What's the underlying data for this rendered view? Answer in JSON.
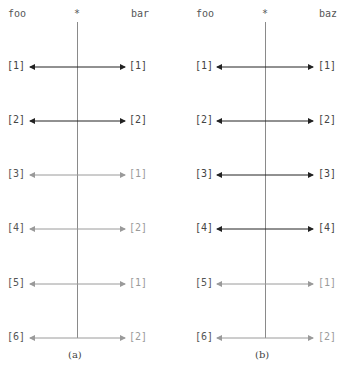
{
  "panels": [
    {
      "id": "a",
      "left_header": "foo",
      "center_header": "*",
      "right_header": "bar",
      "caption": "(a)",
      "rows": [
        {
          "left": "[1]",
          "right": "[1]",
          "emphasis": "dark"
        },
        {
          "left": "[2]",
          "right": "[2]",
          "emphasis": "dark"
        },
        {
          "left": "[3]",
          "right": "[1]",
          "emphasis": "light"
        },
        {
          "left": "[4]",
          "right": "[2]",
          "emphasis": "light"
        },
        {
          "left": "[5]",
          "right": "[1]",
          "emphasis": "light"
        },
        {
          "left": "[6]",
          "right": "[2]",
          "emphasis": "light"
        }
      ]
    },
    {
      "id": "b",
      "left_header": "foo",
      "center_header": "*",
      "right_header": "baz",
      "caption": "(b)",
      "rows": [
        {
          "left": "[1]",
          "right": "[1]",
          "emphasis": "dark"
        },
        {
          "left": "[2]",
          "right": "[2]",
          "emphasis": "dark"
        },
        {
          "left": "[3]",
          "right": "[3]",
          "emphasis": "dark"
        },
        {
          "left": "[4]",
          "right": "[4]",
          "emphasis": "dark"
        },
        {
          "left": "[5]",
          "right": "[1]",
          "emphasis": "light"
        },
        {
          "left": "[6]",
          "right": "[2]",
          "emphasis": "light"
        }
      ]
    }
  ],
  "colors": {
    "dark": "#222222",
    "light": "#9a9a9a",
    "axis": "#8a8a8a"
  }
}
